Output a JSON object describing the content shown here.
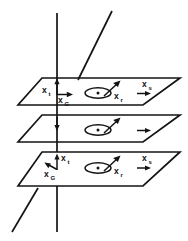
{
  "figure": {
    "type": "technical-line-diagram",
    "colors": {
      "ink": "#141414",
      "background": "#ffffff"
    },
    "planes": [
      {
        "id": "top-plane",
        "name": "upper-plane",
        "labels": {
          "x_t": "x",
          "x_t_sub": "t",
          "x_G": "x",
          "x_G_sub": "G",
          "x_r": "x",
          "x_r_sub": "r",
          "x_s": "x",
          "x_s_sub": "s"
        },
        "has_out_of_plane_symbol": true
      },
      {
        "id": "middle-plane",
        "name": "middle-plane",
        "labels": {},
        "has_out_of_plane_symbol": true
      },
      {
        "id": "bottom-plane",
        "name": "lower-plane",
        "labels": {
          "x_t": "x",
          "x_t_sub": "t",
          "x_G": "x",
          "x_G_sub": "G",
          "x_r": "x",
          "x_r_sub": "r",
          "x_s": "x",
          "x_s_sub": "s"
        },
        "has_out_of_plane_symbol": true
      }
    ],
    "vertical_axis": {
      "name": "vertical-reference-line",
      "visible": true
    },
    "diagonal_axis": {
      "name": "diagonal-reference-line",
      "visible": true
    }
  }
}
